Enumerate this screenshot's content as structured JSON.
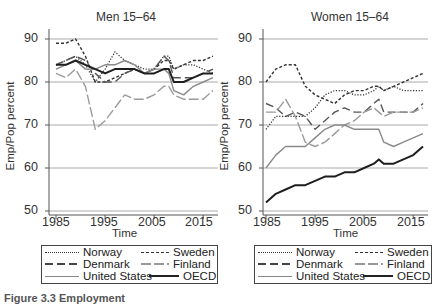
{
  "caption": "Figure 3.3 Employment",
  "chart_data": [
    {
      "type": "line",
      "title": "Men 15–64",
      "xlabel": "Time",
      "ylabel": "Emp/Pop percent",
      "xlim": [
        1985,
        2017
      ],
      "ylim": [
        50,
        90
      ],
      "xticks": [
        1985,
        1995,
        2005,
        2015
      ],
      "yticks": [
        50,
        60,
        70,
        80,
        90
      ],
      "grid": "horizontal",
      "legend_position": "below",
      "x": [
        1985,
        1987,
        1989,
        1991,
        1993,
        1995,
        1997,
        1999,
        2001,
        2003,
        2005,
        2007,
        2008,
        2009,
        2011,
        2013,
        2015,
        2017
      ],
      "series": [
        {
          "name": "Norway",
          "style": "dotted",
          "values": [
            84,
            85,
            86,
            84,
            80,
            83,
            87,
            85,
            84,
            83,
            83,
            86,
            86,
            83,
            84,
            84,
            83,
            82
          ]
        },
        {
          "name": "Sweden",
          "style": "dashed-short",
          "values": [
            89,
            89,
            90,
            86,
            80,
            80,
            81,
            82,
            83,
            82,
            83,
            85,
            85,
            83,
            84,
            85,
            85,
            86
          ]
        },
        {
          "name": "Denmark",
          "style": "dashed-long",
          "values": [
            84,
            85,
            86,
            85,
            82,
            80,
            80,
            82,
            83,
            82,
            83,
            86,
            85,
            81,
            81,
            81,
            82,
            83
          ]
        },
        {
          "name": "Finland",
          "style": "dashed-long-light",
          "values": [
            82,
            81,
            83,
            79,
            69,
            71,
            74,
            77,
            76,
            76,
            77,
            79,
            79,
            77,
            76,
            76,
            76,
            78
          ]
        },
        {
          "name": "United States",
          "style": "solid-light",
          "values": [
            83,
            84,
            85,
            83,
            83,
            84,
            84,
            85,
            84,
            82,
            83,
            83,
            82,
            78,
            77,
            79,
            80,
            81
          ]
        },
        {
          "name": "OECD",
          "style": "solid-dark",
          "values": [
            84,
            84,
            85,
            84,
            83,
            82,
            83,
            83,
            83,
            82,
            82,
            83,
            83,
            80,
            80,
            81,
            82,
            82
          ]
        }
      ]
    },
    {
      "type": "line",
      "title": "Women 15–64",
      "xlabel": "Time",
      "ylabel": "Emp/Pop percent",
      "xlim": [
        1985,
        2017
      ],
      "ylim": [
        50,
        90
      ],
      "xticks": [
        1985,
        1995,
        2005,
        2015
      ],
      "yticks": [
        50,
        60,
        70,
        80,
        90
      ],
      "grid": "horizontal",
      "legend_position": "below",
      "x": [
        1985,
        1987,
        1989,
        1991,
        1993,
        1995,
        1997,
        1999,
        2001,
        2003,
        2005,
        2007,
        2008,
        2009,
        2011,
        2013,
        2015,
        2017
      ],
      "series": [
        {
          "name": "Norway",
          "style": "dotted",
          "values": [
            69,
            72,
            72,
            72,
            72,
            74,
            77,
            78,
            78,
            77,
            77,
            78,
            79,
            78,
            79,
            78,
            78,
            78
          ]
        },
        {
          "name": "Sweden",
          "style": "dashed-short",
          "values": [
            80,
            83,
            84,
            84,
            79,
            77,
            76,
            75,
            77,
            78,
            78,
            79,
            79,
            78,
            79,
            80,
            81,
            82
          ]
        },
        {
          "name": "Denmark",
          "style": "dashed-long",
          "values": [
            75,
            74,
            72,
            73,
            72,
            69,
            71,
            73,
            74,
            73,
            73,
            75,
            76,
            73,
            73,
            73,
            73,
            75
          ]
        },
        {
          "name": "Finland",
          "style": "dashed-long-light",
          "values": [
            73,
            73,
            76,
            72,
            66,
            65,
            66,
            68,
            70,
            71,
            73,
            74,
            73,
            72,
            73,
            73,
            73,
            74
          ]
        },
        {
          "name": "United States",
          "style": "solid-light",
          "values": [
            60,
            63,
            65,
            65,
            65,
            67,
            69,
            70,
            70,
            69,
            69,
            69,
            69,
            66,
            65,
            66,
            67,
            68
          ]
        },
        {
          "name": "OECD",
          "style": "solid-dark",
          "values": [
            52,
            54,
            55,
            56,
            56,
            57,
            58,
            58,
            59,
            59,
            60,
            61,
            62,
            61,
            61,
            62,
            63,
            65
          ]
        }
      ]
    }
  ],
  "panels": [
    {
      "title": "Men 15–64",
      "ylabel": "Emp/Pop percent",
      "xlabel": "Time",
      "xticks": [
        "1985",
        "1995",
        "2005",
        "2015"
      ],
      "yticks": [
        "90",
        "80",
        "70",
        "60",
        "50"
      ],
      "legend": [
        "Norway",
        "Sweden",
        "Denmark",
        "Finland",
        "United States",
        "OECD"
      ]
    },
    {
      "title": "Women 15–64",
      "ylabel": "Emp/Pop percent",
      "xlabel": "Time",
      "xticks": [
        "1985",
        "1995",
        "2005",
        "2015"
      ],
      "yticks": [
        "90",
        "80",
        "70",
        "60",
        "50"
      ],
      "legend": [
        "Norway",
        "Sweden",
        "Denmark",
        "Finland",
        "United States",
        "OECD"
      ]
    }
  ],
  "colors": {
    "axis": "#555555",
    "grid": "#aaaaaa",
    "dark_line": "#222222",
    "mid_line": "#555555",
    "light_line": "#999999"
  }
}
